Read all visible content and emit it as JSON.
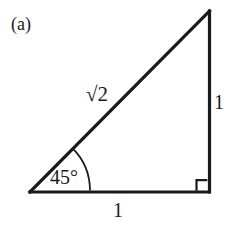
{
  "figure": {
    "panel_label": "(a)",
    "caption_text": "",
    "background_color": "#ffffff",
    "stroke_color": "#1a1a1a",
    "stroke_width": 3,
    "labels": {
      "hypotenuse": "√2",
      "vertical_side": "1",
      "base_side": "1",
      "angle": "45°"
    },
    "geometry": {
      "shape": "right-triangle",
      "vertices": {
        "bottom_left": [
          30,
          192
        ],
        "bottom_right": [
          209,
          192
        ],
        "apex": [
          209,
          11
        ]
      },
      "right_angle_marker": {
        "corner": "bottom-right",
        "size": 11
      },
      "angle_arc": {
        "vertex": "bottom_left",
        "radius": 60,
        "start_degrees": 0,
        "end_degrees": 45
      }
    }
  }
}
